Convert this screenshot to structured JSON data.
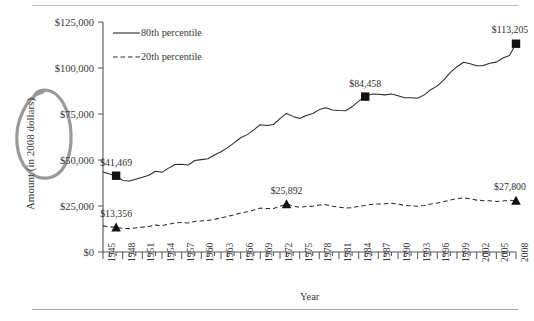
{
  "chart_data": {
    "type": "line",
    "title": "",
    "xlabel": "Year",
    "ylabel": "Amount (in 2008 dollars)",
    "xlim": [
      1945,
      2008
    ],
    "ylim": [
      0,
      125000
    ],
    "grid": false,
    "legend_position": "top-left-inside",
    "x_tick_labels": [
      "1945",
      "1948",
      "1951",
      "1954",
      "1957",
      "1960",
      "1963",
      "1966",
      "1969",
      "1972",
      "1975",
      "1978",
      "1981",
      "1984",
      "1987",
      "1990",
      "1993",
      "1996",
      "1999",
      "2002",
      "2005",
      "2008"
    ],
    "y_tick_labels": [
      "$0",
      "$25,000",
      "$50,000",
      "$75,000",
      "$100,000",
      "$125,000"
    ],
    "y_tick_values": [
      0,
      25000,
      50000,
      75000,
      100000,
      125000
    ],
    "series": [
      {
        "name": "80th percentile",
        "style": "solid",
        "marker": "square",
        "x": [
          1945,
          1946,
          1947,
          1948,
          1949,
          1950,
          1951,
          1952,
          1953,
          1954,
          1955,
          1956,
          1957,
          1958,
          1959,
          1960,
          1961,
          1962,
          1963,
          1964,
          1965,
          1966,
          1967,
          1968,
          1969,
          1970,
          1971,
          1972,
          1973,
          1974,
          1975,
          1976,
          1977,
          1978,
          1979,
          1980,
          1981,
          1982,
          1983,
          1984,
          1985,
          1986,
          1987,
          1988,
          1989,
          1990,
          1991,
          1992,
          1993,
          1994,
          1995,
          1996,
          1997,
          1998,
          1999,
          2000,
          2001,
          2002,
          2003,
          2004,
          2005,
          2006,
          2007,
          2008
        ],
        "values": [
          43500,
          42400,
          41469,
          38900,
          38600,
          39600,
          40600,
          41700,
          43900,
          43300,
          45600,
          47600,
          47700,
          47300,
          49700,
          50200,
          50700,
          52700,
          54500,
          56700,
          59300,
          62100,
          63800,
          66400,
          69200,
          68700,
          69300,
          72500,
          75300,
          73700,
          72600,
          74200,
          75300,
          77400,
          78400,
          77200,
          76900,
          76800,
          78900,
          82000,
          84458,
          85800,
          85700,
          85400,
          85900,
          84900,
          83800,
          83800,
          83600,
          85400,
          88200,
          90300,
          93600,
          97600,
          100700,
          103100,
          102300,
          101200,
          101300,
          102600,
          103200,
          105400,
          106800,
          113205
        ]
      },
      {
        "name": "20th percentile",
        "style": "dashed",
        "marker": "triangle",
        "x": [
          1945,
          1946,
          1947,
          1948,
          1949,
          1950,
          1951,
          1952,
          1953,
          1954,
          1955,
          1956,
          1957,
          1958,
          1959,
          1960,
          1961,
          1962,
          1963,
          1964,
          1965,
          1966,
          1967,
          1968,
          1969,
          1970,
          1971,
          1972,
          1973,
          1974,
          1975,
          1976,
          1977,
          1978,
          1979,
          1980,
          1981,
          1982,
          1983,
          1984,
          1985,
          1986,
          1987,
          1988,
          1989,
          1990,
          1991,
          1992,
          1993,
          1994,
          1995,
          1996,
          1997,
          1998,
          1999,
          2000,
          2001,
          2002,
          2003,
          2004,
          2005,
          2006,
          2007,
          2008
        ],
        "values": [
          14200,
          13700,
          13356,
          12900,
          12700,
          13100,
          13500,
          13900,
          14600,
          14300,
          15100,
          15800,
          16000,
          15800,
          16600,
          16900,
          17100,
          17800,
          18500,
          19300,
          20200,
          21200,
          21900,
          22800,
          23900,
          23600,
          23700,
          24800,
          25892,
          25100,
          24300,
          24700,
          24900,
          25500,
          25700,
          24900,
          24300,
          23900,
          24100,
          24900,
          25300,
          25900,
          26100,
          26200,
          26500,
          26100,
          25300,
          25100,
          24900,
          25300,
          26100,
          26600,
          27400,
          28300,
          29000,
          29400,
          28900,
          28200,
          27900,
          27800,
          27500,
          27700,
          28100,
          27800
        ]
      }
    ],
    "annotations": [
      {
        "name": "label-80th-1947",
        "text": "$41,469",
        "x": 1947,
        "y": 41469
      },
      {
        "name": "label-80th-1985",
        "text": "$84,458",
        "x": 1985,
        "y": 84458
      },
      {
        "name": "label-80th-2008",
        "text": "$113,205",
        "x": 2008,
        "y": 113205
      },
      {
        "name": "label-20th-1947",
        "text": "$13,356",
        "x": 1947,
        "y": 13356
      },
      {
        "name": "label-20th-1973",
        "text": "$25,892",
        "x": 1973,
        "y": 25892
      },
      {
        "name": "label-20th-2008",
        "text": "$27,800",
        "x": 2008,
        "y": 27800
      }
    ],
    "handwritten_annotation": {
      "name": "oval-highlight-ylabel",
      "shape": "oval",
      "color": "#9a9a9a",
      "target": "Amount (in 2008 dollars)"
    },
    "colors": {
      "series_line": "#2b2b2b",
      "marker": "#111111",
      "axis": "#555555",
      "annotation": "#9a9a9a",
      "text": "#3a3a3a"
    }
  },
  "legend": {
    "items": [
      {
        "label": "80th percentile",
        "style": "solid"
      },
      {
        "label": "20th percentile",
        "style": "dashed"
      }
    ]
  },
  "axes": {
    "x_title": "Year",
    "y_title": "Amount (in 2008 dollars)"
  }
}
